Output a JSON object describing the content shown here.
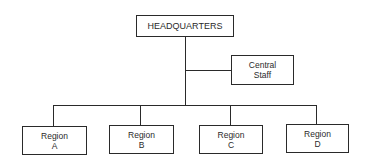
{
  "diagram": {
    "type": "org-chart",
    "root": {
      "label": "HEADQUARTERS"
    },
    "staff": {
      "line1": "Central",
      "line2": "Staff"
    },
    "regions": [
      {
        "line1": "Region",
        "line2": "A"
      },
      {
        "line1": "Region",
        "line2": "B"
      },
      {
        "line1": "Region",
        "line2": "C"
      },
      {
        "line1": "Region",
        "line2": "D"
      }
    ],
    "colors": {
      "line": "#2a2a2a",
      "background": "#ffffff"
    }
  }
}
